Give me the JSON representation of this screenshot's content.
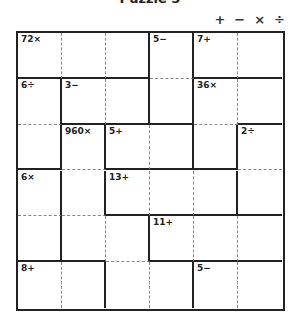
{
  "title": "Puzzle 5",
  "operators": [
    "+",
    "−",
    "×",
    "÷"
  ],
  "grid": {
    "size": 6,
    "cages": [
      {
        "clue": "72×",
        "cells": [
          [
            0,
            0
          ],
          [
            0,
            1
          ],
          [
            0,
            2
          ]
        ]
      },
      {
        "clue": "5−",
        "cells": [
          [
            0,
            3
          ],
          [
            1,
            3
          ]
        ]
      },
      {
        "clue": "7+",
        "cells": [
          [
            0,
            4
          ],
          [
            0,
            5
          ]
        ]
      },
      {
        "clue": "6÷",
        "cells": [
          [
            1,
            0
          ],
          [
            2,
            0
          ]
        ]
      },
      {
        "clue": "3−",
        "cells": [
          [
            1,
            1
          ],
          [
            1,
            2
          ]
        ]
      },
      {
        "clue": "36×",
        "cells": [
          [
            1,
            4
          ],
          [
            1,
            5
          ],
          [
            2,
            4
          ]
        ]
      },
      {
        "clue": "960×",
        "cells": [
          [
            2,
            1
          ],
          [
            3,
            1
          ],
          [
            4,
            1
          ],
          [
            4,
            2
          ],
          [
            5,
            2
          ],
          [
            5,
            3
          ]
        ]
      },
      {
        "clue": "5+",
        "cells": [
          [
            2,
            2
          ],
          [
            2,
            3
          ]
        ]
      },
      {
        "clue": "2÷",
        "cells": [
          [
            2,
            5
          ],
          [
            3,
            5
          ]
        ]
      },
      {
        "clue": "6×",
        "cells": [
          [
            3,
            0
          ],
          [
            4,
            0
          ]
        ]
      },
      {
        "clue": "13+",
        "cells": [
          [
            3,
            2
          ],
          [
            3,
            3
          ],
          [
            3,
            4
          ]
        ]
      },
      {
        "clue": "11+",
        "cells": [
          [
            4,
            3
          ],
          [
            4,
            4
          ],
          [
            4,
            5
          ]
        ]
      },
      {
        "clue": "8+",
        "cells": [
          [
            5,
            0
          ],
          [
            5,
            1
          ]
        ]
      },
      {
        "clue": "5−",
        "cells": [
          [
            5,
            4
          ],
          [
            5,
            5
          ]
        ]
      }
    ]
  }
}
